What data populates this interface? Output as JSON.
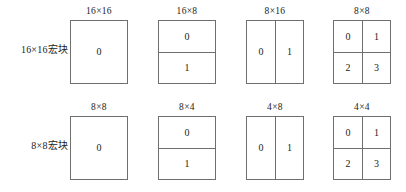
{
  "figure": {
    "background_color": "#ffffff",
    "line_color": "#6f6f6f",
    "text_color": "#222222"
  },
  "rows": [
    {
      "label": "16×16宏块",
      "blocks": [
        {
          "caption": "16×16",
          "split": "none",
          "cells": [
            "0"
          ]
        },
        {
          "caption": "16×8",
          "split": "horiz",
          "cells": [
            "0",
            "1"
          ]
        },
        {
          "caption": "8×16",
          "split": "vert",
          "cells": [
            "0",
            "1"
          ]
        },
        {
          "caption": "8×8",
          "split": "quad",
          "cells": [
            "0",
            "1",
            "2",
            "3"
          ]
        }
      ]
    },
    {
      "label": "8×8宏块",
      "blocks": [
        {
          "caption": "8×8",
          "split": "none",
          "cells": [
            "0"
          ]
        },
        {
          "caption": "8×4",
          "split": "horiz",
          "cells": [
            "0",
            "1"
          ]
        },
        {
          "caption": "4×8",
          "split": "vert",
          "cells": [
            "0",
            "1"
          ]
        },
        {
          "caption": "4×4",
          "split": "quad",
          "cells": [
            "0",
            "1",
            "2",
            "3"
          ]
        }
      ]
    }
  ]
}
